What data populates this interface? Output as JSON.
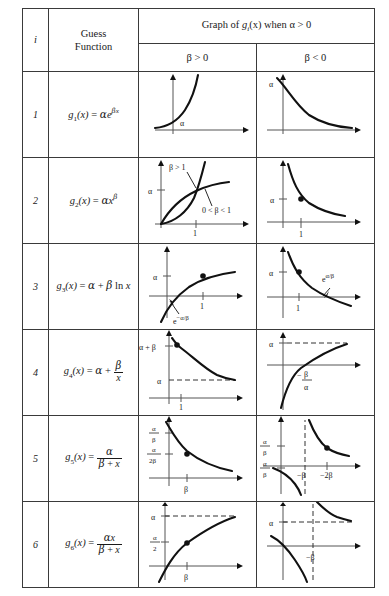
{
  "table": {
    "headers": {
      "index": "i",
      "guess_function_line1": "Guess",
      "guess_function_line2": "Function",
      "graph_title_pre": "Graph of ",
      "graph_title_fn": "g",
      "graph_title_sub": "i",
      "graph_title_post": "(x) when α > 0",
      "beta_positive": "β > 0",
      "beta_negative": "β < 0"
    },
    "rows": [
      {
        "index": "1",
        "function_plain": "g1(x) = αe^(βx)",
        "function_name": "g",
        "function_sub": "1",
        "positive_labels": {
          "y_alpha": "α"
        },
        "negative_labels": {
          "y_alpha": "α"
        }
      },
      {
        "index": "2",
        "function_plain": "g2(x) = αx^β",
        "function_name": "g",
        "function_sub": "2",
        "positive_labels": {
          "y_alpha": "α",
          "x_one": "1",
          "curve_upper": "β > 1",
          "curve_lower": "0 < β < 1"
        },
        "negative_labels": {
          "y_alpha": "α",
          "x_one": "1"
        }
      },
      {
        "index": "3",
        "function_plain": "g3(x) = α + β ln x",
        "function_name": "g",
        "function_sub": "3",
        "positive_labels": {
          "y_alpha": "α",
          "x_one": "1",
          "intercept": "e^(−α/β)"
        },
        "negative_labels": {
          "y_alpha": "α",
          "x_one": "1",
          "intercept": "e^(α/β)"
        }
      },
      {
        "index": "4",
        "function_plain": "g4(x) = α + β/x",
        "function_name": "g",
        "function_sub": "4",
        "positive_labels": {
          "y_alpha_beta": "α + β",
          "y_alpha": "α",
          "x_one": "1"
        },
        "negative_labels": {
          "y_alpha": "α",
          "x_intercept_num": "β",
          "x_intercept_den": "α",
          "x_intercept_sign": "−"
        }
      },
      {
        "index": "5",
        "function_plain": "g5(x) = α/(β + x)",
        "function_name": "g",
        "function_sub": "5",
        "positive_labels": {
          "y_a_over_b_num": "α",
          "y_a_over_b_den": "β",
          "y_a_over_2b_num": "α",
          "y_a_over_2b_den": "2β",
          "x_beta": "β"
        },
        "negative_labels": {
          "y_upper_num": "α",
          "y_upper_den": "β",
          "y_lower_num": "α",
          "y_lower_den": "β",
          "x_minus_beta": "−β",
          "x_minus_2beta": "−2β"
        }
      },
      {
        "index": "6",
        "function_plain": "g6(x) = αx/(β + x)",
        "function_name": "g",
        "function_sub": "6",
        "positive_labels": {
          "y_alpha": "α",
          "y_alpha_over_2_num": "α",
          "y_alpha_over_2_den": "2",
          "x_beta": "β"
        },
        "negative_labels": {
          "y_alpha": "α",
          "x_minus_beta": "−β"
        }
      }
    ]
  },
  "symbols": {
    "alpha": "α",
    "beta": "β",
    "x": "x",
    "e": "e",
    "ln": "ln",
    "equals": "=",
    "plus": "+",
    "minus": "−",
    "one": "1",
    "two": "2"
  }
}
